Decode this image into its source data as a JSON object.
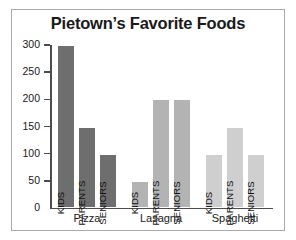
{
  "chart_data": {
    "type": "bar",
    "title": "Pietown’s Favorite Foods",
    "xlabel": "",
    "ylabel": "",
    "ylim": [
      0,
      300
    ],
    "yticks": [
      0,
      50,
      100,
      150,
      200,
      250,
      300
    ],
    "ytick_labels": [
      "0",
      "50",
      "100",
      "150",
      "200",
      "250",
      "300"
    ],
    "grid": false,
    "legend": "none",
    "categories": [
      "Pizza",
      "Lasagna",
      "Spaghetti"
    ],
    "series": [
      {
        "name": "KIDS",
        "values": [
          300,
          50,
          100
        ]
      },
      {
        "name": "PARENTS",
        "values": [
          150,
          200,
          150
        ]
      },
      {
        "name": "SENIORS",
        "values": [
          100,
          200,
          100
        ]
      }
    ],
    "groups": [
      {
        "category": "Pizza",
        "color": "#6e6e6e",
        "bars": [
          {
            "label": "KIDS",
            "value": 300
          },
          {
            "label": "PARENTS",
            "value": 150
          },
          {
            "label": "SENIORS",
            "value": 100
          }
        ]
      },
      {
        "category": "Lasagna",
        "color": "#b3b3b3",
        "bars": [
          {
            "label": "KIDS",
            "value": 50
          },
          {
            "label": "PARENTS",
            "value": 200
          },
          {
            "label": "SENIORS",
            "value": 200
          }
        ]
      },
      {
        "category": "Spaghetti",
        "color": "#cfcfcf",
        "bars": [
          {
            "label": "KIDS",
            "value": 100
          },
          {
            "label": "PARENTS",
            "value": 150
          },
          {
            "label": "SENIORS",
            "value": 100
          }
        ]
      }
    ],
    "colors": {
      "axis": "#4d4d4d",
      "frame": "#a9a9a9",
      "text": "#1a1a1a",
      "background": "#ffffff"
    }
  }
}
